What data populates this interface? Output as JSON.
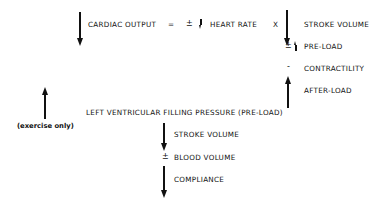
{
  "equation": {
    "lhs": "CARDIAC OUTPUT",
    "equals": "=",
    "plus_minus_1": "±",
    "heart_rate": "HEART RATE",
    "times": "X",
    "stroke_volume": "STROKE VOLUME"
  },
  "stroke_volume_factors": {
    "preload_sign": "±",
    "preload": "PRE-LOAD",
    "contractility_sign": "-",
    "contractility": "CONTRACTILITY",
    "afterload": "AFTER-LOAD"
  },
  "lvfp": {
    "label": "LEFT VENTRICULAR FILLING PRESSURE (PRE-LOAD)",
    "exercise_note": "(exercise only)"
  },
  "lvfp_factors": {
    "stroke_volume": "STROKE VOLUME",
    "blood_volume_sign": "±",
    "blood_volume": "BLOOD VOLUME",
    "compliance": "COMPLIANCE"
  }
}
